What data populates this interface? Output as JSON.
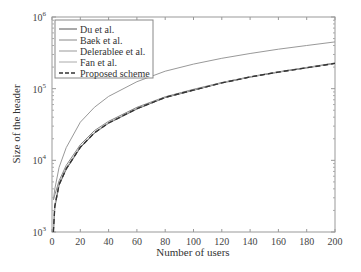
{
  "chart_data": {
    "type": "line",
    "title": "",
    "xlabel": "Number of users",
    "ylabel": "Size of the header",
    "xlim": [
      0,
      200
    ],
    "ylim": [
      1000,
      1000000
    ],
    "yscale": "log",
    "grid": false,
    "legend_position": "upper left",
    "x_ticks": [
      0,
      20,
      40,
      60,
      80,
      100,
      120,
      140,
      160,
      180,
      200
    ],
    "y_ticks": [
      {
        "value": 1000,
        "base": "10",
        "exp": "3"
      },
      {
        "value": 10000,
        "base": "10",
        "exp": "4"
      },
      {
        "value": 100000,
        "base": "10",
        "exp": "5"
      },
      {
        "value": 1000000,
        "base": "10",
        "exp": "6"
      }
    ],
    "x": [
      1,
      2,
      5,
      10,
      20,
      30,
      40,
      60,
      80,
      100,
      120,
      140,
      160,
      180,
      200
    ],
    "series": [
      {
        "name": "Du et al.",
        "color": "#555555",
        "dash": "",
        "values": [
          1000,
          2200,
          4500,
          7500,
          15000,
          24000,
          33000,
          52000,
          75000,
          95000,
          120000,
          145000,
          170000,
          195000,
          225000
        ]
      },
      {
        "name": "Baek et al.",
        "color": "#888888",
        "dash": "",
        "values": [
          2800,
          3300,
          5200,
          8500,
          16500,
          26000,
          35000,
          55000,
          77000,
          98000,
          122000,
          147000,
          172000,
          198000,
          228000
        ]
      },
      {
        "name": "Delerablee et al.",
        "color": "#999999",
        "dash": "",
        "values": [
          2800,
          4000,
          8000,
          15000,
          34000,
          55000,
          78000,
          125000,
          175000,
          220000,
          265000,
          310000,
          355000,
          400000,
          450000
        ]
      },
      {
        "name": "Fan et al.",
        "color": "#aaaaaa",
        "dash": "",
        "values": [
          1000,
          2400,
          4800,
          7800,
          15500,
          24500,
          33500,
          53000,
          76000,
          96000,
          121000,
          146000,
          171000,
          196000,
          226000
        ]
      },
      {
        "name": "Proposed scheme",
        "color": "#333333",
        "dash": "5,3",
        "values": [
          1000,
          2300,
          4600,
          7600,
          15200,
          24200,
          33200,
          52500,
          75500,
          95500,
          120500,
          145500,
          170500,
          195500,
          225500
        ]
      }
    ]
  }
}
